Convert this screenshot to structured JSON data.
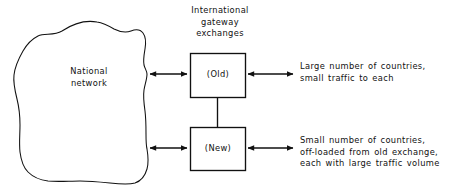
{
  "diagram": {
    "title_block": {
      "lines": [
        "International",
        "gateway",
        "exchanges"
      ],
      "text": "International\ngateway\nexchanges"
    },
    "national_network": {
      "label_lines": [
        "National",
        "network"
      ],
      "text": "National\nnetwork"
    },
    "boxes": [
      {
        "id": "old",
        "label": "(Old)"
      },
      {
        "id": "new",
        "label": "(New)"
      }
    ],
    "annotations": [
      {
        "id": "old-traffic",
        "lines": [
          "Large number of countries,",
          "small traffic to each"
        ],
        "text": "Large number of countries,\nsmall traffic to each"
      },
      {
        "id": "new-traffic",
        "lines": [
          "Small number of countries,",
          "off-loaded from old exchange,",
          "each with large traffic volume"
        ],
        "text": "Small number of countries,\noff-loaded from old exchange,\neach with large traffic volume"
      }
    ],
    "connectors": [
      {
        "id": "network-to-old",
        "type": "double-arrow",
        "orientation": "horizontal"
      },
      {
        "id": "network-to-new",
        "type": "double-arrow",
        "orientation": "horizontal"
      },
      {
        "id": "old-to-new",
        "type": "plain-line",
        "orientation": "vertical"
      },
      {
        "id": "old-to-countries",
        "type": "double-arrow",
        "orientation": "horizontal"
      },
      {
        "id": "new-to-countries",
        "type": "double-arrow",
        "orientation": "horizontal"
      }
    ],
    "colors": {
      "background": "#ffffff",
      "stroke": "#111111",
      "text": "#111111"
    }
  }
}
